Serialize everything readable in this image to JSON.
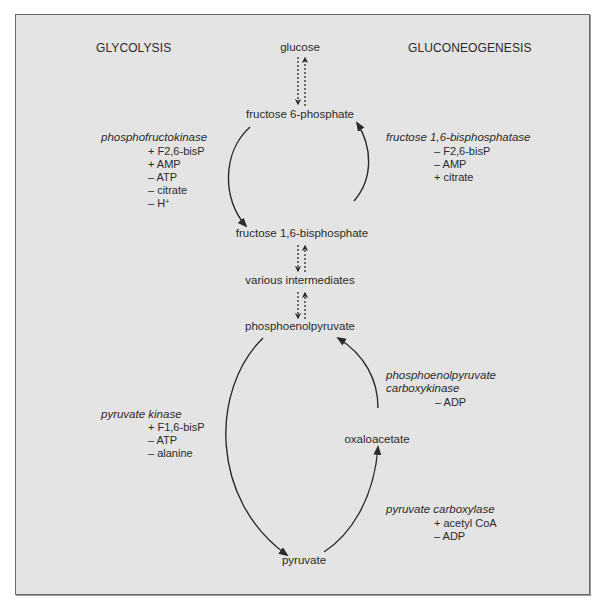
{
  "headers": {
    "left": "GLYCOLYSIS",
    "right": "GLUCONEOGENESIS"
  },
  "metabolites": {
    "glucose": "glucose",
    "f6p": "fructose 6-phosphate",
    "f16bp": "fructose 1,6-bisphosphate",
    "intermediates": "various intermediates",
    "pep": "phosphoenolpyruvate",
    "oxaloacetate": "oxaloacetate",
    "pyruvate": "pyruvate"
  },
  "enzymes": {
    "pfk": {
      "name": "phosphofructokinase",
      "modulators": [
        "+ F2,6-bisP",
        "+ AMP",
        "– ATP",
        "– citrate",
        "– H"
      ],
      "h_superscript": "+"
    },
    "fbpase": {
      "name": "fructose 1,6-bisphosphatase",
      "modulators": [
        "– F2,6-bisP",
        "– AMP",
        "+ citrate"
      ]
    },
    "pk": {
      "name": "pyruvate kinase",
      "modulators": [
        "+ F1,6-bisP",
        "– ATP",
        "– alanine"
      ]
    },
    "pepck": {
      "name_line1": "phosphoenolpyruvate",
      "name_line2": "carboxykinase",
      "modulators": [
        "– ADP"
      ]
    },
    "pc": {
      "name": "pyruvate carboxylase",
      "modulators": [
        "+ acetyl CoA",
        "– ADP"
      ]
    }
  },
  "colors": {
    "background": "#e4e4e4",
    "border": "#6a6a6a",
    "arrow": "#2a2a2a",
    "text": "#2b2b2b"
  }
}
